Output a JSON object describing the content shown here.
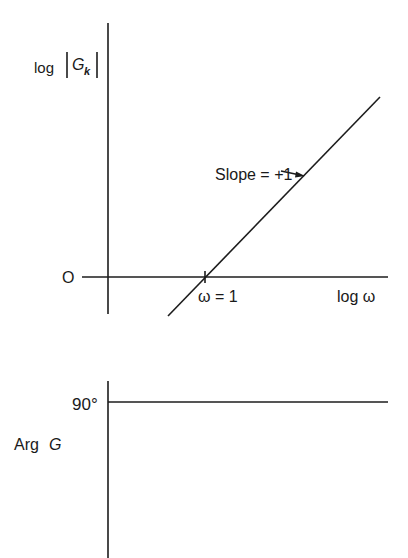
{
  "magnitude_plot": {
    "y_label_prefix": "log",
    "y_label_var": "G",
    "y_label_sub": "k",
    "zero_label": "O",
    "x_label": "log ω",
    "tick_label": "ω = 1",
    "slope_annotation": "Slope = +1",
    "slope_value": 1,
    "crossover_omega": 1
  },
  "phase_plot": {
    "y_label_prefix": "Arg",
    "y_label_var": "G",
    "level_label": "90°",
    "phase_value_deg": 90
  },
  "colors": {
    "ink": "#1c1c1c",
    "background": "#ffffff"
  }
}
